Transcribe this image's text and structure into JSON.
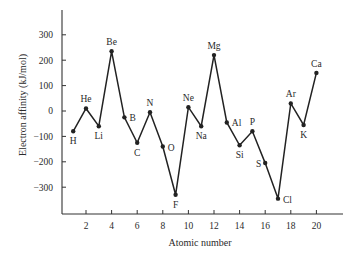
{
  "chart_data": {
    "type": "line",
    "title": "",
    "xlabel": "Atomic number",
    "ylabel": "Electron affinity (kJ/mol)",
    "xlim": [
      0,
      22
    ],
    "ylim": [
      -400,
      400
    ],
    "xticks": [
      2,
      4,
      6,
      8,
      10,
      12,
      14,
      16,
      18,
      20
    ],
    "yticks": [
      300,
      200,
      100,
      0,
      -100,
      -200,
      -300
    ],
    "ytick_labels": [
      "300",
      "200",
      "100",
      "0",
      "−100",
      "−200",
      "−300"
    ],
    "grid": false,
    "legend": null,
    "series": [
      {
        "name": "Electron affinity",
        "color": "#222222",
        "points": [
          {
            "x": 1,
            "label": "H",
            "y": -80,
            "lpos": "below"
          },
          {
            "x": 2,
            "label": "He",
            "y": 10,
            "lpos": "above"
          },
          {
            "x": 3,
            "label": "Li",
            "y": -60,
            "lpos": "below"
          },
          {
            "x": 4,
            "label": "Be",
            "y": 235,
            "lpos": "above"
          },
          {
            "x": 5,
            "label": "B",
            "y": -25,
            "lpos": "right"
          },
          {
            "x": 6,
            "label": "C",
            "y": -125,
            "lpos": "below"
          },
          {
            "x": 7,
            "label": "N",
            "y": -5,
            "lpos": "above"
          },
          {
            "x": 8,
            "label": "O",
            "y": -140,
            "lpos": "right"
          },
          {
            "x": 9,
            "label": "F",
            "y": -330,
            "lpos": "below"
          },
          {
            "x": 10,
            "label": "Ne",
            "y": 15,
            "lpos": "above"
          },
          {
            "x": 11,
            "label": "Na",
            "y": -60,
            "lpos": "below"
          },
          {
            "x": 12,
            "label": "Mg",
            "y": 220,
            "lpos": "above"
          },
          {
            "x": 13,
            "label": "Al",
            "y": -45,
            "lpos": "right"
          },
          {
            "x": 14,
            "label": "Si",
            "y": -135,
            "lpos": "below"
          },
          {
            "x": 15,
            "label": "P",
            "y": -80,
            "lpos": "above"
          },
          {
            "x": 16,
            "label": "S",
            "y": -205,
            "lpos": "left"
          },
          {
            "x": 17,
            "label": "Cl",
            "y": -345,
            "lpos": "right"
          },
          {
            "x": 18,
            "label": "Ar",
            "y": 30,
            "lpos": "above"
          },
          {
            "x": 19,
            "label": "K",
            "y": -55,
            "lpos": "below"
          },
          {
            "x": 20,
            "label": "Ca",
            "y": 150,
            "lpos": "above"
          }
        ]
      }
    ]
  },
  "layout_px": {
    "x0": 60.4,
    "x_per_unit": 12.8,
    "y0": 111,
    "y_per_100": 25.4,
    "axis_left": 62,
    "axis_top": 10,
    "axis_bottom": 214,
    "axis_right": 343
  }
}
